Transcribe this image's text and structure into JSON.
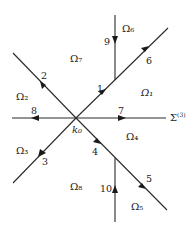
{
  "diagram": {
    "center_label": "k₀",
    "contour_label": "Σ",
    "contour_superscript": "(3)",
    "contours": [
      {
        "id": "1",
        "label": "1"
      },
      {
        "id": "2",
        "label": "2"
      },
      {
        "id": "3",
        "label": "3"
      },
      {
        "id": "4",
        "label": "4"
      },
      {
        "id": "5",
        "label": "5"
      },
      {
        "id": "6",
        "label": "6"
      },
      {
        "id": "7",
        "label": "7"
      },
      {
        "id": "8",
        "label": "8"
      },
      {
        "id": "9",
        "label": "9"
      },
      {
        "id": "10",
        "label": "10"
      }
    ],
    "regions": [
      {
        "id": "omega1",
        "label": "Ω₁"
      },
      {
        "id": "omega2",
        "label": "Ω₂"
      },
      {
        "id": "omega3",
        "label": "Ω₃"
      },
      {
        "id": "omega4",
        "label": "Ω₄"
      },
      {
        "id": "omega5",
        "label": "Ω₅"
      },
      {
        "id": "omega6",
        "label": "Ω₆"
      },
      {
        "id": "omega7",
        "label": "Ω₇"
      },
      {
        "id": "omega8",
        "label": "Ω₈"
      }
    ]
  }
}
